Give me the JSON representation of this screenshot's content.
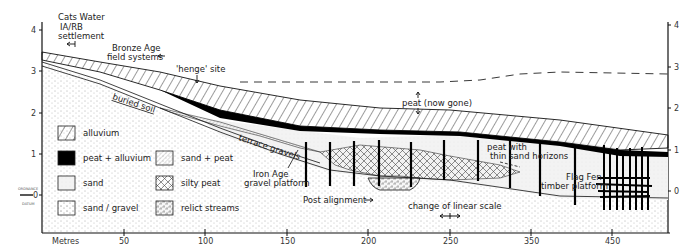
{
  "axis": {
    "x_label": "Metres",
    "x_ticks": [
      "50",
      "100",
      "150",
      "200",
      "250",
      "350",
      "450"
    ],
    "y_ticks_left": [
      "4",
      "3",
      "2",
      "1",
      "0"
    ],
    "y_ticks_right": [
      "4",
      "3",
      "2",
      "1",
      "0"
    ],
    "datum_top": "ORDNANCE",
    "datum_bottom": "DATUM"
  },
  "annotations": {
    "cats_water_1": "Cats Water",
    "cats_water_2": "IA/RB",
    "cats_water_3": "settlement",
    "bronze_age_1": "Bronze Age",
    "bronze_age_2": "field systems",
    "henge": "'henge' site",
    "peat_gone": "peat (now gone)",
    "buried_soil": "buried soil",
    "terrace_gravels": "terrace gravels",
    "iron_age_1": "Iron Age",
    "iron_age_2": "gravel platform",
    "post_alignment": "Post alignment",
    "scale_change": "change of linear scale",
    "peat_sand_1": "peat with",
    "peat_sand_2": "thin sand horizons",
    "flag_fen_1": "Flag Fen",
    "flag_fen_2": "timber platform"
  },
  "legend": [
    {
      "key": "alluvium",
      "label": "alluvium"
    },
    {
      "key": "peat_alluvium",
      "label": "peat + alluvium"
    },
    {
      "key": "sand",
      "label": "sand"
    },
    {
      "key": "sand_gravel",
      "label": "sand / gravel"
    },
    {
      "key": "sand_peat",
      "label": "sand + peat"
    },
    {
      "key": "silty_peat",
      "label": "silty peat"
    },
    {
      "key": "relict_streams",
      "label": "relict streams"
    }
  ]
}
